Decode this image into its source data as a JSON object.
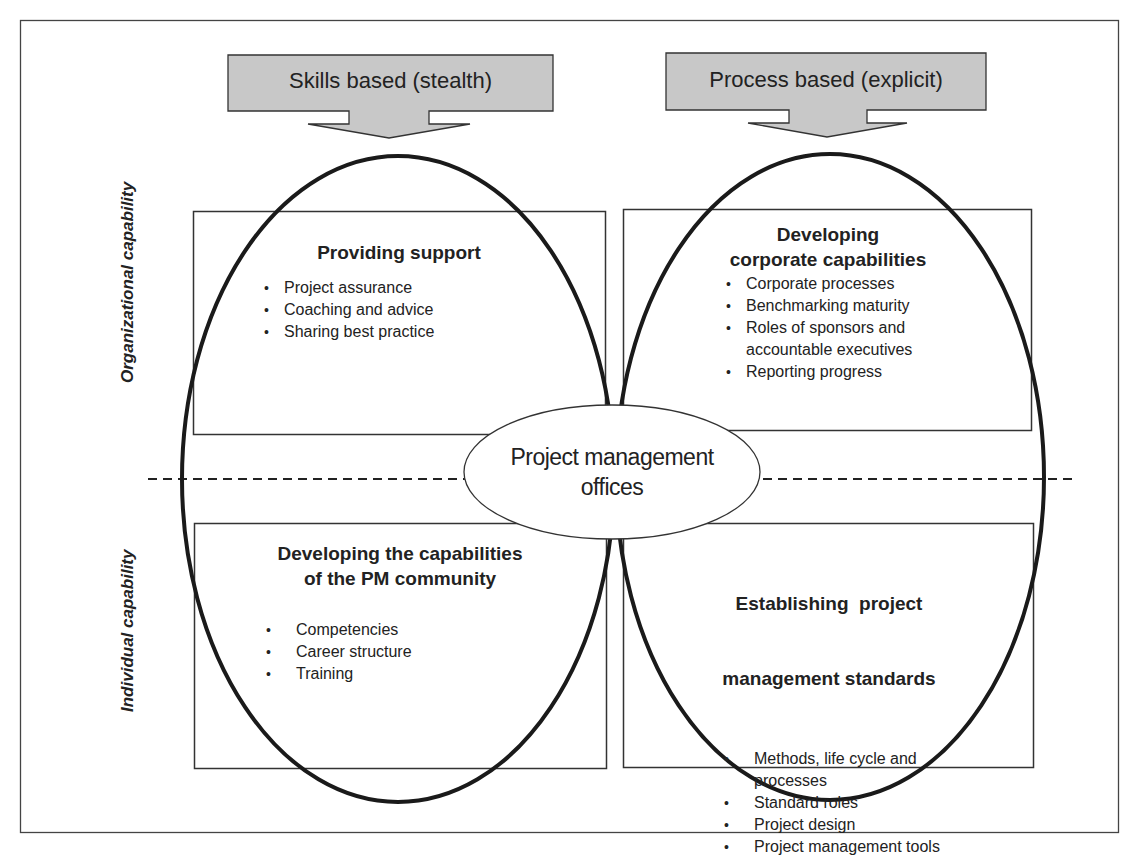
{
  "diagram": {
    "type": "pmo-capability-matrix",
    "arrows": {
      "left": {
        "label": "Skills based (stealth)"
      },
      "right": {
        "label": "Process based (explicit)"
      }
    },
    "axis_labels": {
      "top": "Organizational capability",
      "bottom": "Individual capability"
    },
    "center": {
      "line1": "Project management",
      "line2": "offices"
    },
    "quadrants": {
      "top_left": {
        "title": "Providing support",
        "items": [
          "Project assurance",
          "Coaching and advice",
          "Sharing best practice"
        ]
      },
      "top_right": {
        "title_line1": "Developing",
        "title_line2": "corporate capabilities",
        "items": [
          "Corporate processes",
          "Benchmarking maturity",
          "Roles of sponsors and accountable executives",
          "Reporting progress"
        ]
      },
      "bottom_left": {
        "title_line1": "Developing the capabilities",
        "title_line2": "of the PM community",
        "items": [
          "Competencies",
          "Career structure",
          "Training"
        ]
      },
      "bottom_right": {
        "title_line1": "Establishing  project",
        "title_line2": "management standards",
        "items": [
          "Methods, life cycle and processes",
          "Standard roles",
          "Project design",
          "Project management tools"
        ]
      }
    },
    "colors": {
      "arrow_fill": "#c8c8c8",
      "stroke": "#1a1a1a",
      "frame": "#444444"
    }
  }
}
